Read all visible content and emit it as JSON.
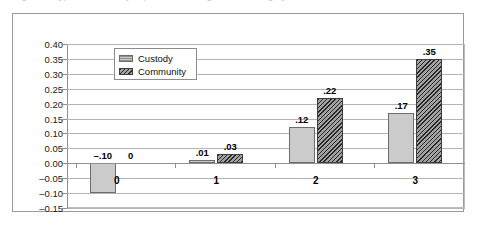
{
  "figure": {
    "caption_remnant": "Figure 1.  Type of offence  by  supervision setting  and  risk category"
  },
  "legend": {
    "position": "inside-top-left",
    "items": [
      {
        "label": "Custody",
        "swatch": "light-gray-solid"
      },
      {
        "label": "Community",
        "swatch": "dark-gray-diagonal-hatch"
      }
    ]
  },
  "chart_data": {
    "type": "bar",
    "title": "",
    "xlabel": "",
    "ylabel": "",
    "categories": [
      "0",
      "1",
      "2",
      "3"
    ],
    "series": [
      {
        "name": "Custody",
        "values": [
          -0.1,
          0.01,
          0.12,
          0.17
        ],
        "labels": [
          "-.10",
          ".01",
          ".12",
          ".17"
        ],
        "color": "#cbcbcb"
      },
      {
        "name": "Community",
        "values": [
          0.0,
          0.03,
          0.22,
          0.35
        ],
        "labels": [
          "0",
          ".03",
          ".22",
          ".35"
        ],
        "color": "#5d5d5d"
      }
    ],
    "ylim": [
      -0.15,
      0.4
    ],
    "ytick_step": 0.05,
    "yticks": [
      "0.40",
      "0.35",
      "0.30",
      "0.25",
      "0.20",
      "0.15",
      "0.10",
      "0.05",
      "0.00",
      "-0.05",
      "-0.10",
      "-0.15"
    ],
    "grid": true,
    "legend_position": "inside-top-left"
  }
}
